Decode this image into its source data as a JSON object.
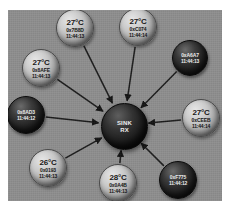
{
  "diagram": {
    "canvas_color": "#8e8e8e",
    "hub": {
      "line1": "SINK",
      "line2": "RX",
      "style": "dark"
    },
    "nodes": [
      {
        "id": "n1",
        "temp": "27°C",
        "addr": "0x7B8D",
        "ts": "11:44:13",
        "style": "light",
        "cx": 67,
        "cy": 18,
        "r": 19
      },
      {
        "id": "n2",
        "temp": "27°C",
        "addr": "0xC074",
        "ts": "11:44:14",
        "style": "light",
        "cx": 130,
        "cy": 17,
        "r": 19
      },
      {
        "id": "n3",
        "temp": "",
        "addr": "0xA6A7",
        "ts": "11:44:13",
        "style": "dark",
        "cx": 182,
        "cy": 48,
        "r": 18
      },
      {
        "id": "n4",
        "temp": "27°C",
        "addr": "0xCEEB",
        "ts": "11:44:14",
        "style": "light",
        "cx": 193,
        "cy": 108,
        "r": 19
      },
      {
        "id": "n5",
        "temp": "",
        "addr": "0xF775",
        "ts": "11:44:12",
        "style": "dark",
        "cx": 170,
        "cy": 170,
        "r": 19
      },
      {
        "id": "n6",
        "temp": "28°C",
        "addr": "0x0A4B",
        "ts": "11:44:13",
        "style": "light",
        "cx": 110,
        "cy": 173,
        "r": 19
      },
      {
        "id": "n7",
        "temp": "26°C",
        "addr": "0x0193",
        "ts": "11:44:13",
        "style": "light",
        "cx": 40,
        "cy": 158,
        "r": 19
      },
      {
        "id": "n8",
        "temp": "",
        "addr": "0x8AD3",
        "ts": "11:44:12",
        "style": "dark",
        "cx": 18,
        "cy": 105,
        "r": 19
      },
      {
        "id": "n9",
        "temp": "27°C",
        "addr": "0x8AFE",
        "ts": "11:44:13",
        "style": "light",
        "cx": 33,
        "cy": 58,
        "r": 19
      }
    ],
    "edge_color": "#1b1b1b",
    "edge_direction": "node-to-hub"
  }
}
